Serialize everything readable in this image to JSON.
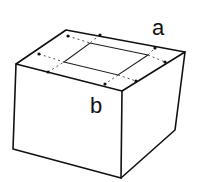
{
  "diagram": {
    "type": "box-with-folded-top",
    "labels": {
      "a": "a",
      "b": "b"
    },
    "colors": {
      "stroke": "#111111",
      "background": "#ffffff",
      "dash": "#555555"
    }
  }
}
